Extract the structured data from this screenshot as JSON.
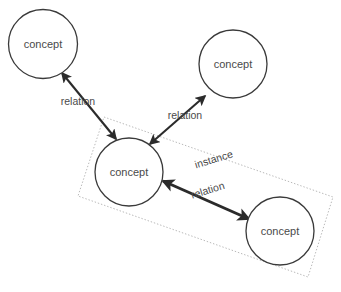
{
  "diagram": {
    "background_color": "#ffffff",
    "stroke_color": "#2b2b2b",
    "node_stroke_color": "#3a3a3a",
    "text_color": "#4a4a4a",
    "group_stroke_color": "#b9b9b9",
    "nodes": [
      {
        "id": "concept-top-left",
        "label": "concept",
        "cx": 43,
        "cy": 44,
        "r": 34.5
      },
      {
        "id": "concept-top-right",
        "label": "concept",
        "cx": 233,
        "cy": 64,
        "r": 34.0
      },
      {
        "id": "concept-middle-left",
        "label": "concept",
        "cx": 129,
        "cy": 172,
        "r": 34.0
      },
      {
        "id": "concept-bottom-right",
        "label": "concept",
        "cx": 280,
        "cy": 231,
        "r": 34.0
      }
    ],
    "edges": [
      {
        "id": "edge-topleft-to-middle",
        "label": "relation",
        "from": "concept-top-left",
        "to": "concept-middle-left",
        "arrowheads": "both",
        "weight": "thin",
        "x1": 62,
        "y1": 73,
        "x2": 116,
        "y2": 139,
        "label_x": 78,
        "label_y": 102,
        "label_rotation": 0
      },
      {
        "id": "edge-middle-to-topright",
        "label": "relation",
        "from": "concept-middle-left",
        "to": "concept-top-right",
        "arrowheads": "both",
        "weight": "thin",
        "x1": 150,
        "y1": 144,
        "x2": 205,
        "y2": 96,
        "label_x": 185,
        "label_y": 116,
        "label_rotation": 0
      },
      {
        "id": "edge-middle-to-bottomright",
        "label": "relation",
        "from": "concept-middle-left",
        "to": "concept-bottom-right",
        "arrowheads": "both",
        "weight": "thick",
        "x1": 163,
        "y1": 181,
        "x2": 249,
        "y2": 219,
        "label_x": 208,
        "label_y": 191,
        "label_rotation": -17
      }
    ],
    "groups": [
      {
        "id": "instance-group",
        "label": "instance",
        "members": [
          "concept-middle-left",
          "concept-bottom-right"
        ],
        "corners": "104,117 333,197 308,277 78,196",
        "label_x": 214,
        "label_y": 160,
        "label_rotation": -17
      }
    ]
  }
}
